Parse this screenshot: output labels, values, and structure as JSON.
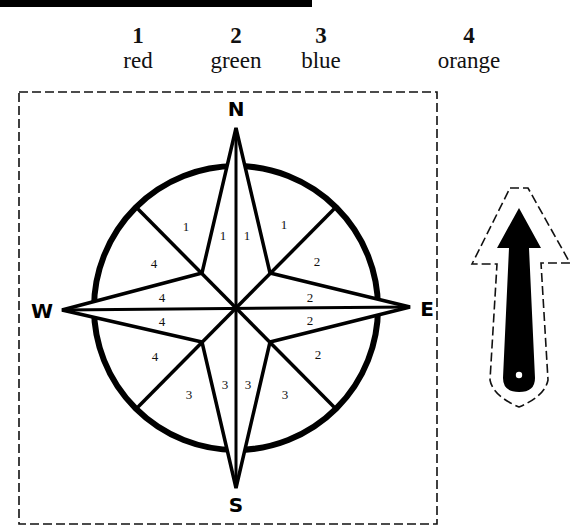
{
  "legend": [
    {
      "number": "1",
      "color_name": "red",
      "color": "#e53935"
    },
    {
      "number": "2",
      "color_name": "green",
      "color": "#43a047"
    },
    {
      "number": "3",
      "color_name": "blue",
      "color": "#1e88e5"
    },
    {
      "number": "4",
      "color_name": "orange",
      "color": "#fb8c00"
    }
  ],
  "compass": {
    "directions": {
      "north": "N",
      "east": "E",
      "south": "S",
      "west": "W"
    },
    "segments": [
      {
        "region": "nw-outer",
        "label": "1"
      },
      {
        "region": "n-left",
        "label": "1"
      },
      {
        "region": "n-right",
        "label": "1"
      },
      {
        "region": "ne-outer",
        "label": "1"
      },
      {
        "region": "ne-lower",
        "label": "2"
      },
      {
        "region": "e-upper",
        "label": "2"
      },
      {
        "region": "e-lower",
        "label": "2"
      },
      {
        "region": "se-outer",
        "label": "2"
      },
      {
        "region": "se-lower",
        "label": "3"
      },
      {
        "region": "s-right",
        "label": "3"
      },
      {
        "region": "s-left",
        "label": "3"
      },
      {
        "region": "sw-lower",
        "label": "3"
      },
      {
        "region": "sw-outer",
        "label": "4"
      },
      {
        "region": "w-lower",
        "label": "4"
      },
      {
        "region": "w-upper",
        "label": "4"
      },
      {
        "region": "nw-lower",
        "label": "4"
      }
    ]
  },
  "pointer": {
    "type": "cut-out arrow",
    "direction": "up"
  }
}
